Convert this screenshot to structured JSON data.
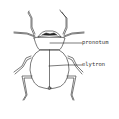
{
  "diagram": {
    "line_color": "#222222",
    "background": "#ffffff",
    "labels": [
      {
        "text": "pronotum",
        "x": 84,
        "y": 40
      },
      {
        "text": "elytron",
        "x": 84,
        "y": 62
      }
    ]
  }
}
